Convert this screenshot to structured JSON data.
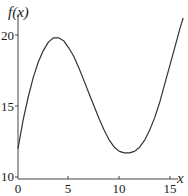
{
  "chart_data": {
    "type": "line",
    "title": "",
    "xlabel": "x",
    "ylabel": "f(x)",
    "xlim": [
      0,
      16.3
    ],
    "ylim": [
      10,
      21.2
    ],
    "x_ticks": [
      0,
      5,
      10,
      15
    ],
    "y_ticks": [
      10,
      15,
      20
    ],
    "x_tick_labels": [
      "0",
      "5",
      "10",
      "15"
    ],
    "y_tick_labels": [
      "10",
      "15",
      "20"
    ],
    "grid": false,
    "legend": null,
    "series": [
      {
        "name": "f(x)",
        "x": [
          0,
          0.5,
          1,
          1.5,
          2,
          2.5,
          3,
          3.5,
          4,
          4.5,
          5,
          5.5,
          6,
          6.5,
          7,
          7.5,
          8,
          8.5,
          9,
          9.5,
          10,
          10.5,
          11,
          11.5,
          12,
          12.5,
          13,
          13.5,
          14,
          14.5,
          15,
          15.5,
          16,
          16.3
        ],
        "values": [
          12.0,
          14.0,
          15.6,
          17.0,
          18.1,
          18.9,
          19.5,
          19.8,
          19.8,
          19.6,
          19.1,
          18.5,
          17.7,
          16.8,
          15.9,
          15.0,
          14.1,
          13.3,
          12.6,
          12.1,
          11.8,
          11.7,
          11.7,
          11.8,
          12.1,
          12.6,
          13.3,
          14.2,
          15.3,
          16.6,
          17.9,
          19.2,
          20.5,
          21.2
        ],
        "color": "#333333"
      }
    ]
  },
  "labels": {
    "ylabel": "f(x)",
    "xlabel": "x",
    "x_ticks": [
      "0",
      "5",
      "10",
      "15"
    ],
    "y_ticks": [
      "10",
      "15",
      "20"
    ]
  }
}
